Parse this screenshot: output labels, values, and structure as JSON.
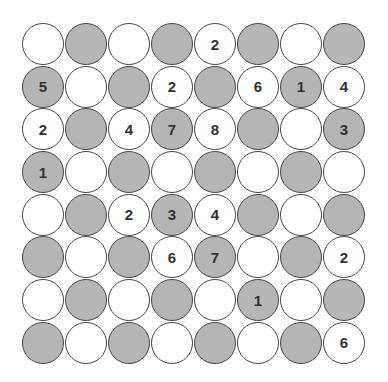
{
  "puzzle": {
    "rows": 8,
    "cols": 8,
    "colors": {
      "shaded": "#b5b5b5",
      "white": "#ffffff",
      "border": "#4a4a4a",
      "text": "#333333"
    },
    "grid": [
      [
        {
          "s": 0,
          "v": ""
        },
        {
          "s": 1,
          "v": ""
        },
        {
          "s": 0,
          "v": ""
        },
        {
          "s": 1,
          "v": ""
        },
        {
          "s": 0,
          "v": "2"
        },
        {
          "s": 1,
          "v": ""
        },
        {
          "s": 0,
          "v": ""
        },
        {
          "s": 1,
          "v": ""
        }
      ],
      [
        {
          "s": 1,
          "v": "5"
        },
        {
          "s": 0,
          "v": ""
        },
        {
          "s": 1,
          "v": ""
        },
        {
          "s": 0,
          "v": "2"
        },
        {
          "s": 1,
          "v": ""
        },
        {
          "s": 0,
          "v": "6"
        },
        {
          "s": 1,
          "v": "1"
        },
        {
          "s": 0,
          "v": "4"
        }
      ],
      [
        {
          "s": 0,
          "v": "2"
        },
        {
          "s": 1,
          "v": ""
        },
        {
          "s": 0,
          "v": "4"
        },
        {
          "s": 1,
          "v": "7"
        },
        {
          "s": 0,
          "v": "8"
        },
        {
          "s": 1,
          "v": ""
        },
        {
          "s": 0,
          "v": ""
        },
        {
          "s": 1,
          "v": "3"
        }
      ],
      [
        {
          "s": 1,
          "v": "1"
        },
        {
          "s": 0,
          "v": ""
        },
        {
          "s": 1,
          "v": ""
        },
        {
          "s": 0,
          "v": ""
        },
        {
          "s": 1,
          "v": ""
        },
        {
          "s": 0,
          "v": ""
        },
        {
          "s": 1,
          "v": ""
        },
        {
          "s": 0,
          "v": ""
        }
      ],
      [
        {
          "s": 0,
          "v": ""
        },
        {
          "s": 1,
          "v": ""
        },
        {
          "s": 0,
          "v": "2"
        },
        {
          "s": 1,
          "v": "3"
        },
        {
          "s": 0,
          "v": "4"
        },
        {
          "s": 1,
          "v": ""
        },
        {
          "s": 0,
          "v": ""
        },
        {
          "s": 1,
          "v": ""
        }
      ],
      [
        {
          "s": 1,
          "v": ""
        },
        {
          "s": 0,
          "v": ""
        },
        {
          "s": 1,
          "v": ""
        },
        {
          "s": 0,
          "v": "6"
        },
        {
          "s": 1,
          "v": "7"
        },
        {
          "s": 0,
          "v": ""
        },
        {
          "s": 1,
          "v": ""
        },
        {
          "s": 0,
          "v": "2"
        }
      ],
      [
        {
          "s": 0,
          "v": ""
        },
        {
          "s": 1,
          "v": ""
        },
        {
          "s": 0,
          "v": ""
        },
        {
          "s": 1,
          "v": ""
        },
        {
          "s": 0,
          "v": ""
        },
        {
          "s": 1,
          "v": "1"
        },
        {
          "s": 0,
          "v": ""
        },
        {
          "s": 1,
          "v": ""
        }
      ],
      [
        {
          "s": 1,
          "v": ""
        },
        {
          "s": 0,
          "v": ""
        },
        {
          "s": 1,
          "v": ""
        },
        {
          "s": 0,
          "v": ""
        },
        {
          "s": 1,
          "v": ""
        },
        {
          "s": 0,
          "v": ""
        },
        {
          "s": 1,
          "v": ""
        },
        {
          "s": 0,
          "v": "6"
        }
      ]
    ]
  }
}
